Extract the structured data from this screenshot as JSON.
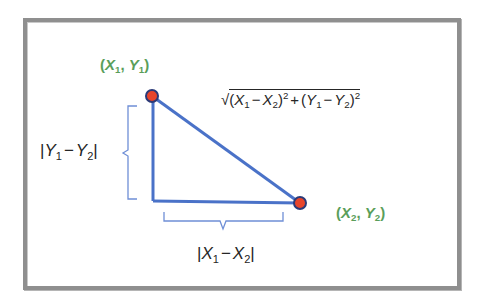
{
  "diagram": {
    "type": "distance-formula-right-triangle",
    "point1": {
      "label_open": "(",
      "x_var": "X",
      "x_sub": "1",
      "comma": ", ",
      "y_var": "Y",
      "y_sub": "1",
      "label_close": ")",
      "position": [
        152,
        96
      ]
    },
    "point2": {
      "label_open": "(",
      "x_var": "X",
      "x_sub": "2",
      "comma": ", ",
      "y_var": "Y",
      "y_sub": "2",
      "label_close": ")",
      "position": [
        300,
        203
      ]
    },
    "right_angle_corner": [
      153,
      201
    ],
    "vertical_leg": {
      "bar_open": "|",
      "a_var": "Y",
      "a_sub": "1",
      "minus": "−",
      "b_var": "Y",
      "b_sub": "2",
      "bar_close": "|"
    },
    "horizontal_leg": {
      "bar_open": "|",
      "a_var": "X",
      "a_sub": "1",
      "minus": "−",
      "b_var": "X",
      "b_sub": "2",
      "bar_close": "|"
    },
    "hypotenuse_formula": {
      "radical": "√",
      "p1_open": "(",
      "x1": "X",
      "x1_sub": "1",
      "minus1": "−",
      "x2": "X",
      "x2_sub": "2",
      "p1_close": ")",
      "exp1": "2",
      "plus": "+",
      "p2_open": "(",
      "y1": "Y",
      "y1_sub": "1",
      "minus2": "−",
      "y2": "Y",
      "y2_sub": "2",
      "p2_close": ")",
      "exp2": "2"
    },
    "colors": {
      "line": "#4a72c8",
      "brace": "#6f8fd6",
      "point_fill": "#e8452b",
      "point_stroke": "#2b3a78",
      "point_label": "#5a9e5a",
      "text": "#262626",
      "frame": "#8f8f8f"
    }
  }
}
